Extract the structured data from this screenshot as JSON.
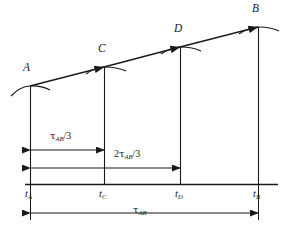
{
  "figure": {
    "type": "line-diagram",
    "background_color": "#ffffff",
    "line_color": "#1a1a1a"
  },
  "curve": {
    "name": "rising-trend-line",
    "points": [
      {
        "id": "A",
        "label": "A",
        "x": 30,
        "y": 86
      },
      {
        "id": "C",
        "label": "C",
        "x": 104,
        "y": 67
      },
      {
        "id": "D",
        "label": "D",
        "x": 180,
        "y": 47
      },
      {
        "id": "B",
        "label": "B",
        "x": 258,
        "y": 27
      }
    ]
  },
  "axis": {
    "name": "time-axis",
    "baseline_y": 184,
    "x_start": 25,
    "x_end": 278,
    "ticks": [
      {
        "id": "tA",
        "base": "t",
        "subscript": "A",
        "x": 30
      },
      {
        "id": "tC",
        "base": "t",
        "subscript": "C",
        "x": 104
      },
      {
        "id": "tD",
        "base": "t",
        "subscript": "D",
        "x": 180
      },
      {
        "id": "tB",
        "base": "t",
        "subscript": "B",
        "x": 258
      }
    ]
  },
  "dimensions": [
    {
      "id": "tau-third",
      "prefix": "",
      "tau": "τ",
      "subscript": "AB",
      "suffix": "/3",
      "from_x": 30,
      "to_x": 104,
      "y": 150,
      "label_x": 50,
      "label_y": 133
    },
    {
      "id": "two-tau-thirds",
      "prefix": "2",
      "tau": "τ",
      "subscript": "AB",
      "suffix": "/3",
      "from_x": 30,
      "to_x": 180,
      "y": 168,
      "label_x": 114,
      "label_y": 151
    },
    {
      "id": "tau-total",
      "prefix": "",
      "tau": "τ",
      "subscript": "AB",
      "suffix": "",
      "from_x": 30,
      "to_x": 258,
      "y": 213,
      "label_x": 133,
      "label_y": 206
    }
  ]
}
